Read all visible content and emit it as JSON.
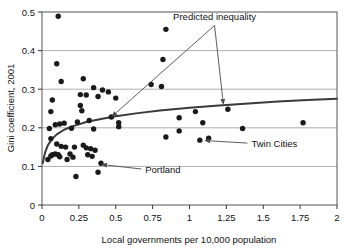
{
  "chart_data": {
    "type": "scatter",
    "title": "",
    "xlabel": "Local governments per 10,000 population",
    "ylabel": "Gini coefficient, 2001",
    "xlim": [
      0,
      2
    ],
    "ylim": [
      0,
      0.5
    ],
    "grid": true,
    "xticks": [
      0,
      0.25,
      0.5,
      0.75,
      1,
      1.25,
      1.5,
      1.75,
      2
    ],
    "xtick_labels": [
      "0",
      "0.25",
      "0.5",
      "0.75",
      "1",
      "1.25",
      "1.5",
      "1.75",
      "2"
    ],
    "yticks": [
      0,
      0.1,
      0.2,
      0.3,
      0.4,
      0.5
    ],
    "ytick_labels": [
      "0",
      "0.1",
      "0.2",
      "0.3",
      "0.4",
      "0.5"
    ],
    "legend_position": "none",
    "series": [
      {
        "name": "Metropolitan areas",
        "type": "scatter",
        "marker": "filled-circle",
        "color": "#1a1a1a",
        "points": [
          [
            0.11,
            0.489
          ],
          [
            0.1,
            0.366
          ],
          [
            0.13,
            0.32
          ],
          [
            0.28,
            0.327
          ],
          [
            0.35,
            0.304
          ],
          [
            0.07,
            0.272
          ],
          [
            0.26,
            0.286
          ],
          [
            0.3,
            0.285
          ],
          [
            0.41,
            0.298
          ],
          [
            0.45,
            0.293
          ],
          [
            0.38,
            0.281
          ],
          [
            0.5,
            0.277
          ],
          [
            0.74,
            0.312
          ],
          [
            0.84,
            0.455
          ],
          [
            0.82,
            0.377
          ],
          [
            0.81,
            0.307
          ],
          [
            0.06,
            0.242
          ],
          [
            0.26,
            0.258
          ],
          [
            0.27,
            0.244
          ],
          [
            0.24,
            0.215
          ],
          [
            0.32,
            0.219
          ],
          [
            0.47,
            0.228
          ],
          [
            0.52,
            0.213
          ],
          [
            0.93,
            0.226
          ],
          [
            1.04,
            0.242
          ],
          [
            1.09,
            0.213
          ],
          [
            1.26,
            0.248
          ],
          [
            1.36,
            0.198
          ],
          [
            0.05,
            0.198
          ],
          [
            0.09,
            0.208
          ],
          [
            0.12,
            0.21
          ],
          [
            0.15,
            0.212
          ],
          [
            0.2,
            0.199
          ],
          [
            0.35,
            0.197
          ],
          [
            0.52,
            0.203
          ],
          [
            0.84,
            0.176
          ],
          [
            1.77,
            0.213
          ],
          [
            0.06,
            0.172
          ],
          [
            0.1,
            0.158
          ],
          [
            0.13,
            0.152
          ],
          [
            0.16,
            0.15
          ],
          [
            0.22,
            0.15
          ],
          [
            0.28,
            0.155
          ],
          [
            0.3,
            0.148
          ],
          [
            0.33,
            0.146
          ],
          [
            0.36,
            0.142
          ],
          [
            0.93,
            0.192
          ],
          [
            1.07,
            0.168
          ],
          [
            1.13,
            0.173
          ],
          [
            0.04,
            0.118
          ],
          [
            0.06,
            0.127
          ],
          [
            0.07,
            0.13
          ],
          [
            0.09,
            0.132
          ],
          [
            0.11,
            0.13
          ],
          [
            0.12,
            0.125
          ],
          [
            0.17,
            0.118
          ],
          [
            0.19,
            0.132
          ],
          [
            0.21,
            0.124
          ],
          [
            0.31,
            0.13
          ],
          [
            0.34,
            0.126
          ],
          [
            0.4,
            0.108
          ],
          [
            0.23,
            0.074
          ],
          [
            0.38,
            0.085
          ]
        ]
      },
      {
        "name": "Predicted inequality",
        "type": "line",
        "color": "#3a3a3a",
        "points": [
          [
            0.005,
            0.108
          ],
          [
            0.02,
            0.135
          ],
          [
            0.04,
            0.155
          ],
          [
            0.07,
            0.172
          ],
          [
            0.1,
            0.183
          ],
          [
            0.15,
            0.195
          ],
          [
            0.2,
            0.203
          ],
          [
            0.3,
            0.215
          ],
          [
            0.4,
            0.223
          ],
          [
            0.5,
            0.23
          ],
          [
            0.65,
            0.238
          ],
          [
            0.8,
            0.245
          ],
          [
            1.0,
            0.252
          ],
          [
            1.2,
            0.258
          ],
          [
            1.4,
            0.263
          ],
          [
            1.6,
            0.268
          ],
          [
            1.8,
            0.272
          ],
          [
            2.0,
            0.275
          ]
        ]
      }
    ],
    "annotations": [
      {
        "name": "predicted-inequality",
        "label": "Predicted inequality",
        "label_x": 1.17,
        "label_y": 0.478,
        "targets": [
          [
            0.47,
            0.228
          ],
          [
            1.23,
            0.259
          ]
        ]
      },
      {
        "name": "portland",
        "label": "Portland",
        "label_x": 0.7,
        "label_y": 0.083,
        "targets": [
          [
            0.4,
            0.105
          ]
        ]
      },
      {
        "name": "twin-cities",
        "label": "Twin Cities",
        "label_x": 1.42,
        "label_y": 0.15,
        "targets": [
          [
            1.1,
            0.167
          ]
        ]
      }
    ]
  }
}
